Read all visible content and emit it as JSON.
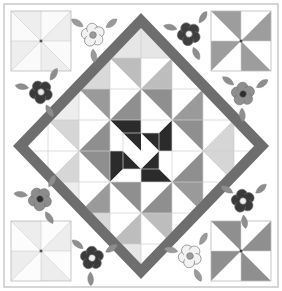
{
  "artwork": {
    "title": "Medallion Quilt Block",
    "kind": "quilt-block-illustration",
    "width": 282,
    "height": 291,
    "background": "#ffffff"
  },
  "palette": {
    "white": "#ffffff",
    "off_white": "#fbfbfb",
    "very_light_gray": "#f0f0f0",
    "light_gray": "#e2e2e2",
    "pale_gray": "#d6d6d6",
    "mid_light_gray": "#bdbdbd",
    "mid_gray": "#9a9a9a",
    "gray": "#8a8a8a",
    "dark_gray": "#5f5f5f",
    "darker_gray": "#4a4a4a",
    "near_black": "#2b2b2b",
    "outline": "#b9b9b9",
    "hairline": "#cfcfcf",
    "sash": "#6e6e6e"
  },
  "outer_frame": {
    "name": "outer border",
    "stroke": "#c9c9c9",
    "stroke_width": 1.5,
    "x": 4,
    "y": 4,
    "w": 274,
    "h": 283
  },
  "diamond_sash": {
    "name": "on-point diamond sash",
    "fill": "#6e6e6e",
    "band_width": 10,
    "points_outer": [
      [
        141,
        13
      ],
      [
        269,
        146
      ],
      [
        141,
        279
      ],
      [
        13,
        146
      ]
    ],
    "points_inner": [
      [
        141,
        28
      ],
      [
        254,
        146
      ],
      [
        141,
        264
      ],
      [
        28,
        146
      ]
    ]
  },
  "center_pinwheel": {
    "name": "center four-patch pinwheel",
    "colors": [
      "#2b2b2b",
      "#ffffff"
    ],
    "cx": 141,
    "cy": 151,
    "half": 18
  },
  "inner_field": {
    "note": "8x8 grid of half-square triangles clipped to the diamond interior",
    "grid": 8,
    "cell": 31,
    "origin_x": 17,
    "origin_y": 27,
    "tones": [
      "#ffffff",
      "#f0f0f0",
      "#e2e2e2",
      "#d6d6d6",
      "#bdbdbd",
      "#9a9a9a",
      "#8a8a8a",
      "#5f5f5f",
      "#2b2b2b"
    ]
  },
  "corner_pinwheels": [
    {
      "name": "top-left corner pinwheel",
      "cx": 41,
      "cy": 41,
      "r": 30,
      "blade_color": "#eeeeee",
      "ground_color": "#fafafa",
      "hub_color": "#555555"
    },
    {
      "name": "top-right corner pinwheel",
      "cx": 241,
      "cy": 41,
      "r": 30,
      "blade_color": "#9d9d9d",
      "ground_color": "#ffffff",
      "hub_color": "#444444"
    },
    {
      "name": "bottom-left corner pinwheel",
      "cx": 41,
      "cy": 251,
      "r": 30,
      "blade_color": "#ededed",
      "ground_color": "#fcfcfc",
      "hub_color": "#555555"
    },
    {
      "name": "bottom-right corner pinwheel",
      "cx": 241,
      "cy": 251,
      "r": 30,
      "blade_color": "#8f8f8f",
      "ground_color": "#ffffff",
      "hub_color": "#3a3a3a"
    }
  ],
  "flowers": [
    {
      "name": "flower-top-left-dark",
      "cx": 41,
      "cy": 92,
      "scale": 1.0,
      "petal": "#3a3a3a",
      "center": "#e8e8e8",
      "leaf": "#8e8e8e",
      "rot": -12
    },
    {
      "name": "flower-top-center-light",
      "cx": 93,
      "cy": 35,
      "scale": 1.0,
      "petal": "#f2f2f2",
      "center": "#9b9b9b",
      "leaf": "#9a9a9a",
      "rot": 10
    },
    {
      "name": "flower-top-right-dark",
      "cx": 189,
      "cy": 34,
      "scale": 1.0,
      "petal": "#3f3f3f",
      "center": "#f2f2f2",
      "leaf": "#8e8e8e",
      "rot": -8
    },
    {
      "name": "flower-right-upper-gray",
      "cx": 243,
      "cy": 94,
      "scale": 1.0,
      "petal": "#8f8f8f",
      "center": "#2e2e2e",
      "leaf": "#8e8e8e",
      "rot": 14
    },
    {
      "name": "flower-left-lower-gray",
      "cx": 40,
      "cy": 199,
      "scale": 1.0,
      "petal": "#8c8c8c",
      "center": "#2e2e2e",
      "leaf": "#8e8e8e",
      "rot": -14
    },
    {
      "name": "flower-right-lower-dark",
      "cx": 243,
      "cy": 201,
      "scale": 1.0,
      "petal": "#3a3a3a",
      "center": "#f0f0f0",
      "leaf": "#8e8e8e",
      "rot": 8
    },
    {
      "name": "flower-bottom-left-dark",
      "cx": 92,
      "cy": 258,
      "scale": 1.0,
      "petal": "#3a3a3a",
      "center": "#f0f0f0",
      "leaf": "#8e8e8e",
      "rot": 16
    },
    {
      "name": "flower-bottom-right-light",
      "cx": 190,
      "cy": 256,
      "scale": 1.0,
      "petal": "#f2f2f2",
      "center": "#9b9b9b",
      "leaf": "#9a9a9a",
      "rot": -10
    }
  ],
  "hst_cells": [
    {
      "r": 0,
      "c": 3,
      "d": "tl",
      "a": "#ffffff",
      "b": "#e6e6e6"
    },
    {
      "r": 0,
      "c": 4,
      "d": "tr",
      "a": "#ffffff",
      "b": "#e6e6e6"
    },
    {
      "r": 1,
      "c": 2,
      "d": "tl",
      "a": "#ffffff",
      "b": "#d9d9d9"
    },
    {
      "r": 1,
      "c": 3,
      "d": "tr",
      "a": "#bdbdbd",
      "b": "#ffffff"
    },
    {
      "r": 1,
      "c": 4,
      "d": "tl",
      "a": "#ffffff",
      "b": "#bdbdbd"
    },
    {
      "r": 1,
      "c": 5,
      "d": "tr",
      "a": "#d9d9d9",
      "b": "#ffffff"
    },
    {
      "r": 2,
      "c": 1,
      "d": "tl",
      "a": "#ffffff",
      "b": "#ededed"
    },
    {
      "r": 2,
      "c": 2,
      "d": "tr",
      "a": "#9a9a9a",
      "b": "#ffffff"
    },
    {
      "r": 2,
      "c": 3,
      "d": "tl",
      "a": "#ffffff",
      "b": "#8f8f8f"
    },
    {
      "r": 2,
      "c": 4,
      "d": "tr",
      "a": "#8f8f8f",
      "b": "#ffffff"
    },
    {
      "r": 2,
      "c": 5,
      "d": "tl",
      "a": "#ffffff",
      "b": "#9a9a9a"
    },
    {
      "r": 2,
      "c": 6,
      "d": "tr",
      "a": "#ededed",
      "b": "#ffffff"
    },
    {
      "r": 3,
      "c": 1,
      "d": "tr",
      "a": "#d6d6d6",
      "b": "#ffffff"
    },
    {
      "r": 3,
      "c": 2,
      "d": "tl",
      "a": "#ffffff",
      "b": "#8f8f8f"
    },
    {
      "r": 3,
      "c": 3,
      "d": "tr",
      "a": "#2b2b2b",
      "b": "#ffffff"
    },
    {
      "r": 3,
      "c": 4,
      "d": "tl",
      "a": "#ffffff",
      "b": "#2b2b2b"
    },
    {
      "r": 3,
      "c": 5,
      "d": "tr",
      "a": "#8f8f8f",
      "b": "#ffffff"
    },
    {
      "r": 3,
      "c": 6,
      "d": "tl",
      "a": "#ffffff",
      "b": "#d6d6d6"
    },
    {
      "r": 4,
      "c": 1,
      "d": "tl",
      "a": "#ffffff",
      "b": "#d6d6d6"
    },
    {
      "r": 4,
      "c": 2,
      "d": "tr",
      "a": "#8f8f8f",
      "b": "#ffffff"
    },
    {
      "r": 4,
      "c": 3,
      "d": "tl",
      "a": "#2b2b2b",
      "b": "#ffffff"
    },
    {
      "r": 4,
      "c": 4,
      "d": "tr",
      "a": "#ffffff",
      "b": "#2b2b2b"
    },
    {
      "r": 4,
      "c": 5,
      "d": "tl",
      "a": "#ffffff",
      "b": "#8f8f8f"
    },
    {
      "r": 4,
      "c": 6,
      "d": "tr",
      "a": "#d6d6d6",
      "b": "#ffffff"
    },
    {
      "r": 5,
      "c": 1,
      "d": "tr",
      "a": "#ededed",
      "b": "#ffffff"
    },
    {
      "r": 5,
      "c": 2,
      "d": "tl",
      "a": "#ffffff",
      "b": "#9a9a9a"
    },
    {
      "r": 5,
      "c": 3,
      "d": "tr",
      "a": "#8f8f8f",
      "b": "#ffffff"
    },
    {
      "r": 5,
      "c": 4,
      "d": "tl",
      "a": "#ffffff",
      "b": "#8f8f8f"
    },
    {
      "r": 5,
      "c": 5,
      "d": "tr",
      "a": "#9a9a9a",
      "b": "#ffffff"
    },
    {
      "r": 5,
      "c": 6,
      "d": "tl",
      "a": "#ffffff",
      "b": "#ededed"
    },
    {
      "r": 6,
      "c": 2,
      "d": "tr",
      "a": "#d9d9d9",
      "b": "#ffffff"
    },
    {
      "r": 6,
      "c": 3,
      "d": "tl",
      "a": "#ffffff",
      "b": "#bdbdbd"
    },
    {
      "r": 6,
      "c": 4,
      "d": "tr",
      "a": "#bdbdbd",
      "b": "#ffffff"
    },
    {
      "r": 6,
      "c": 5,
      "d": "tl",
      "a": "#ffffff",
      "b": "#d9d9d9"
    },
    {
      "r": 7,
      "c": 3,
      "d": "tr",
      "a": "#e6e6e6",
      "b": "#ffffff"
    },
    {
      "r": 7,
      "c": 4,
      "d": "tl",
      "a": "#ffffff",
      "b": "#e6e6e6"
    }
  ]
}
